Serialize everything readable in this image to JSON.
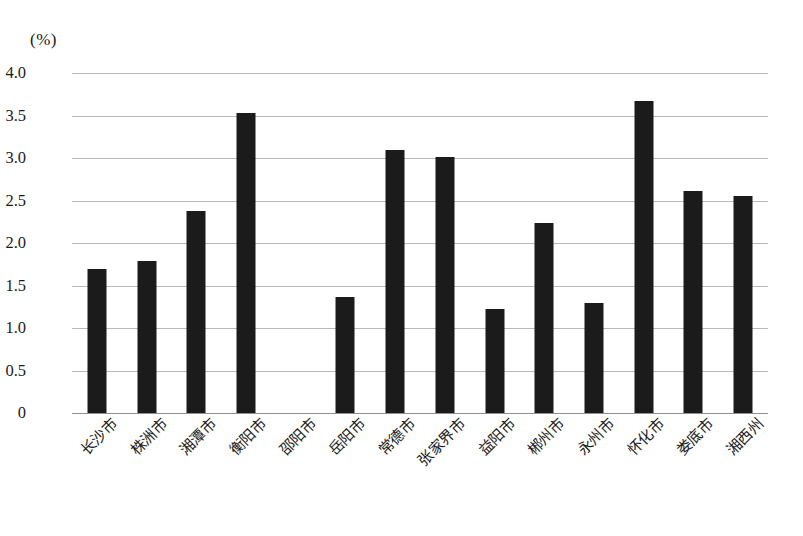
{
  "chart_data": {
    "type": "bar",
    "title": "",
    "subtitle": "",
    "xlabel": "",
    "ylabel": "",
    "unit_label": "(%)",
    "ylim": [
      0,
      4.0
    ],
    "ytick_labels": [
      "4.0",
      "3.5",
      "3.0",
      "2.5",
      "2.0",
      "1.5",
      "1.0",
      "0.5",
      "0"
    ],
    "ytick_values": [
      4.0,
      3.5,
      3.0,
      2.5,
      2.0,
      1.5,
      1.0,
      0.5,
      0
    ],
    "grid": true,
    "legend": "none",
    "bar_color": "#1b1b1b",
    "grid_color": "#b9b9b9",
    "categories": [
      "长沙市",
      "株洲市",
      "湘潭市",
      "衡阳市",
      "邵阳市",
      "岳阳市",
      "常德市",
      "张家界市",
      "益阳市",
      "郴州市",
      "永州市",
      "怀化市",
      "娄底市",
      "湘西州"
    ],
    "values": [
      1.7,
      1.79,
      2.38,
      3.53,
      0,
      1.37,
      3.09,
      3.01,
      1.22,
      2.23,
      1.3,
      3.67,
      2.61,
      2.55
    ],
    "annotations": []
  }
}
